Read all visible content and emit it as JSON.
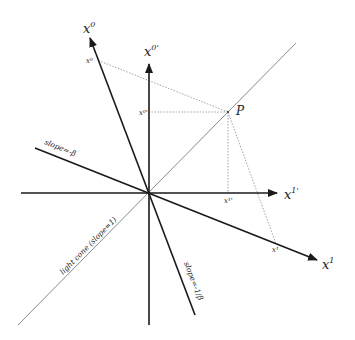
{
  "diagram": {
    "colors": {
      "axis": "#1a1a1a",
      "light_cone": "#8a8a8a",
      "dotted": "#9a9a9a",
      "background": "#ffffff"
    },
    "labels": {
      "x0_axis": "x",
      "x0_axis_sup": "0",
      "x0prime_axis": "x",
      "x0prime_axis_sup": "0'",
      "x1_axis": "x",
      "x1_axis_sup": "1",
      "x1prime_axis": "x",
      "x1prime_axis_sup": "1'",
      "event": "P",
      "proj_x0": "x⁰",
      "proj_x0prime": "x⁰'",
      "proj_x1": "x¹",
      "proj_x1prime": "x¹'",
      "slope_beta": "slope=-β",
      "slope_inv_beta": "slope=-1/β",
      "light_cone": "light cone (slope=1)"
    },
    "points": {
      "origin": [
        149,
        193
      ],
      "P": [
        228,
        112
      ],
      "x0_proj": [
        97,
        60
      ],
      "x0prime_proj": [
        149,
        112
      ],
      "x1prime_proj": [
        228,
        193
      ],
      "x1_proj": [
        276,
        244
      ]
    }
  }
}
